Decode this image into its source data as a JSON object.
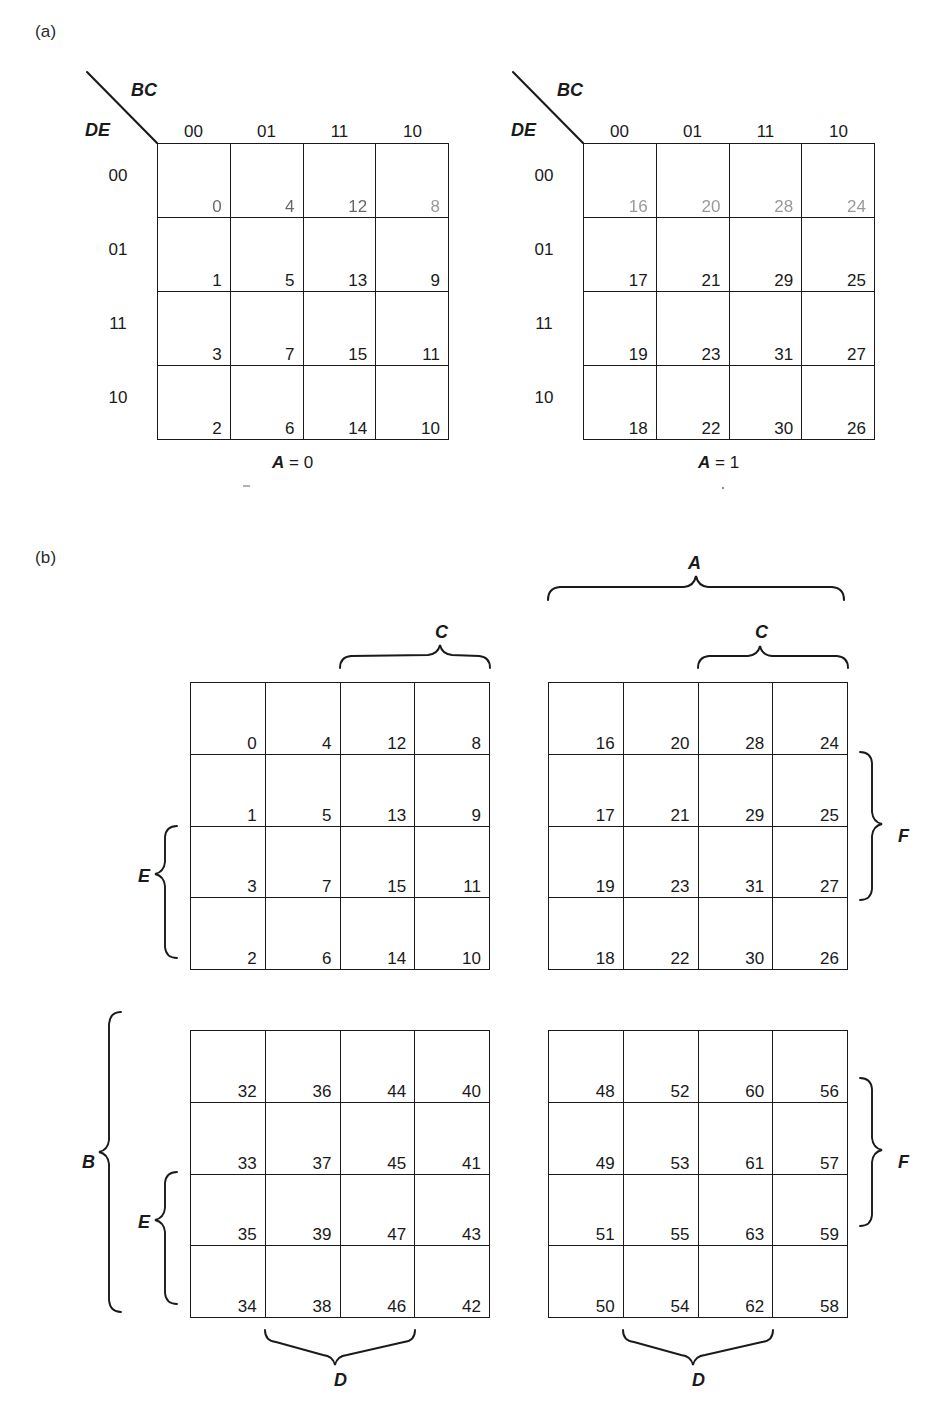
{
  "figure": {
    "panel_a_label": "(a)",
    "panel_b_label": "(b)"
  },
  "panel_a": {
    "maps": [
      {
        "name": "map-a0",
        "corner_top_label": "BC",
        "corner_left_label": "DE",
        "col_headers": [
          "00",
          "01",
          "11",
          "10"
        ],
        "row_headers": [
          "00",
          "01",
          "11",
          "10"
        ],
        "caption_var": "A",
        "caption_rest": "= 0",
        "cells": [
          [
            "0",
            "4",
            "12",
            "8"
          ],
          [
            "1",
            "5",
            "13",
            "9"
          ],
          [
            "3",
            "7",
            "15",
            "11"
          ],
          [
            "2",
            "6",
            "14",
            "10"
          ]
        ]
      },
      {
        "name": "map-a1",
        "corner_top_label": "BC",
        "corner_left_label": "DE",
        "col_headers": [
          "00",
          "01",
          "11",
          "10"
        ],
        "row_headers": [
          "00",
          "01",
          "11",
          "10"
        ],
        "caption_var": "A",
        "caption_rest": "= 1",
        "cells": [
          [
            "16",
            "20",
            "28",
            "24"
          ],
          [
            "17",
            "21",
            "29",
            "25"
          ],
          [
            "19",
            "23",
            "31",
            "27"
          ],
          [
            "18",
            "22",
            "30",
            "26"
          ]
        ]
      }
    ]
  },
  "panel_b": {
    "maps": [
      {
        "name": "map-b-top-left",
        "cells": [
          [
            "0",
            "4",
            "12",
            "8"
          ],
          [
            "1",
            "5",
            "13",
            "9"
          ],
          [
            "3",
            "7",
            "15",
            "11"
          ],
          [
            "2",
            "6",
            "14",
            "10"
          ]
        ]
      },
      {
        "name": "map-b-top-right",
        "cells": [
          [
            "16",
            "20",
            "28",
            "24"
          ],
          [
            "17",
            "21",
            "29",
            "25"
          ],
          [
            "19",
            "23",
            "31",
            "27"
          ],
          [
            "18",
            "22",
            "30",
            "26"
          ]
        ]
      },
      {
        "name": "map-b-bottom-left",
        "cells": [
          [
            "32",
            "36",
            "44",
            "40"
          ],
          [
            "33",
            "37",
            "45",
            "41"
          ],
          [
            "35",
            "39",
            "47",
            "43"
          ],
          [
            "34",
            "38",
            "46",
            "42"
          ]
        ]
      },
      {
        "name": "map-b-bottom-right",
        "cells": [
          [
            "48",
            "52",
            "60",
            "56"
          ],
          [
            "49",
            "53",
            "61",
            "57"
          ],
          [
            "51",
            "55",
            "63",
            "59"
          ],
          [
            "50",
            "54",
            "62",
            "58"
          ]
        ]
      }
    ],
    "braces": {
      "a_top": "A",
      "c_top_left": "C",
      "c_top_right": "C",
      "e_top_left": "E",
      "e_bottom_left": "E",
      "b_left": "B",
      "f_top_right": "F",
      "f_bottom_right": "F",
      "d_bottom_left": "D",
      "d_bottom_right": "D"
    }
  }
}
